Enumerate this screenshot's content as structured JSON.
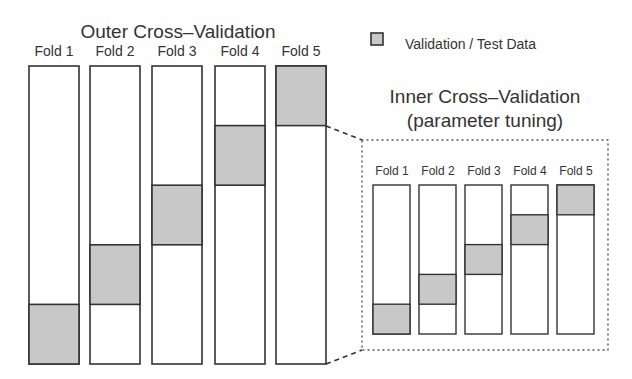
{
  "outer": {
    "title": "Outer Cross–Validation",
    "folds": [
      {
        "label": "Fold 1",
        "test_segment": 1
      },
      {
        "label": "Fold 2",
        "test_segment": 2
      },
      {
        "label": "Fold 3",
        "test_segment": 3
      },
      {
        "label": "Fold 4",
        "test_segment": 4
      },
      {
        "label": "Fold 5",
        "test_segment": 5
      }
    ],
    "segments_per_fold": 5
  },
  "inner": {
    "title_line1": "Inner Cross–Validation",
    "title_line2": "(parameter tuning)",
    "folds": [
      {
        "label": "Fold 1",
        "test_segment": 1
      },
      {
        "label": "Fold 2",
        "test_segment": 2
      },
      {
        "label": "Fold 3",
        "test_segment": 3
      },
      {
        "label": "Fold 4",
        "test_segment": 4
      },
      {
        "label": "Fold 5",
        "test_segment": 5
      }
    ],
    "segments_per_fold": 5
  },
  "legend": {
    "label": "Validation / Test Data"
  },
  "colors": {
    "test_fill": "#c8c8c8",
    "train_fill": "#ffffff",
    "stroke": "#333333"
  }
}
